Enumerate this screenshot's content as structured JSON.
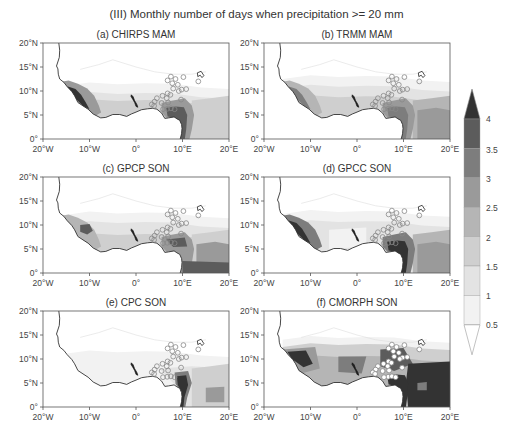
{
  "figure": {
    "title": "(III) Monthly number of days when precipitation >= 20 mm"
  },
  "chart_data": {
    "type": "heatmap",
    "title": "(III) Monthly number of days when precipitation >= 20 mm",
    "xlabel": "Longitude",
    "ylabel": "Latitude",
    "xlim": [
      -20,
      20
    ],
    "ylim": [
      0,
      20
    ],
    "x_ticks": [
      "20°W",
      "10°W",
      "0°",
      "10°E",
      "20°E"
    ],
    "y_ticks": [
      "0°",
      "5°N",
      "10°N",
      "15°N",
      "20°N"
    ],
    "colorbar": {
      "levels": [
        0.5,
        1,
        1.5,
        2,
        2.5,
        3,
        3.5,
        4
      ],
      "tick_labels": [
        "0.5",
        "1",
        "1.5",
        "2",
        "2.5",
        "3",
        "3.5",
        "4"
      ],
      "extend": "both",
      "colors": [
        "#ffffff",
        "#f2f2f2",
        "#e3e3e3",
        "#cfcfcf",
        "#b5b5b5",
        "#9a9a9a",
        "#7d7d7d",
        "#5c5c5c",
        "#333333"
      ]
    },
    "panels": [
      {
        "id": "a",
        "label": "(a) CHIRPS MAM",
        "dataset": "CHIRPS",
        "season": "MAM",
        "description": "Maxima (>=3.5) along Guinea/Sierra Leone coast and Cameroon/Gulf of Guinea; values decrease northward to <0.5 by ~12°N"
      },
      {
        "id": "b",
        "label": "(b) TRMM MAM",
        "dataset": "TRMM",
        "season": "MAM",
        "description": "Maxima (>=3) on SW coast and Cameroon coast; moderate values (1.5-2.5) over Central Africa 0-8°N"
      },
      {
        "id": "c",
        "label": "(c) GPCP SON",
        "dataset": "GPCP",
        "season": "SON",
        "description": "Maxima around Sierra Leone/Guinea (~3.5) and Cameroon line; band of 1-2 between 5-12°N"
      },
      {
        "id": "d",
        "label": "(d) GPCC SON",
        "dataset": "GPCC",
        "season": "SON",
        "description": "Strong maxima (>4) along Guinea-Liberia coast and Cameroon coast; 1.5-3 over Central Africa"
      },
      {
        "id": "e",
        "label": "(e) CPC SON",
        "dataset": "CPC",
        "season": "SON",
        "description": "Generally low (<1.5) except strong maximum (>4) over Cameroon ~3-7°N, 9-12°E"
      },
      {
        "id": "f",
        "label": "(f) CMORPH SON",
        "dataset": "CMORPH",
        "season": "SON",
        "description": "Widespread high values: >3.5 over Guinea, central Nigeria, Cameroon and Central Africa; 1-2.5 band up to ~14°N"
      }
    ],
    "stations_note": "Open circles mark station locations over Nigeria/Cameroon region (~3-11°E, 6-13°N)"
  },
  "panels": [
    {
      "label": "(a) CHIRPS MAM"
    },
    {
      "label": "(b) TRMM MAM"
    },
    {
      "label": "(c) GPCP SON"
    },
    {
      "label": "(d) GPCC SON"
    },
    {
      "label": "(e) CPC SON"
    },
    {
      "label": "(f) CMORPH SON"
    }
  ],
  "axes": {
    "x_ticks": [
      "20°W",
      "10°W",
      "0°",
      "10°E",
      "20°E"
    ],
    "y_ticks": [
      "0°",
      "5°N",
      "10°N",
      "15°N",
      "20°N"
    ]
  },
  "colorbar": {
    "labels": [
      "4",
      "3.5",
      "3",
      "2.5",
      "2",
      "1.5",
      "1",
      "0.5"
    ]
  }
}
